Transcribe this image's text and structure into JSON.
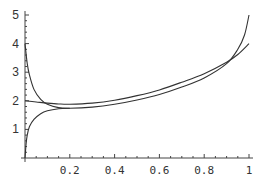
{
  "chart_data": {
    "type": "line",
    "title": "",
    "xlabel": "",
    "ylabel": "",
    "xlim": [
      0,
      1
    ],
    "ylim": [
      0,
      5
    ],
    "grid": false,
    "legend": null,
    "x_ticks": [
      "0.2",
      "0.4",
      "0.6",
      "0.8",
      "1"
    ],
    "y_ticks": [
      "1",
      "2",
      "3",
      "4",
      "5"
    ],
    "series": [
      {
        "name": "curve-a",
        "x": [
          0.0,
          0.05,
          0.1,
          0.15,
          0.2,
          0.3,
          0.4,
          0.5,
          0.6,
          0.7,
          0.8,
          0.9,
          0.95,
          1.0
        ],
        "y": [
          2.0,
          1.96,
          1.92,
          1.89,
          1.88,
          1.92,
          2.02,
          2.18,
          2.38,
          2.65,
          2.95,
          3.35,
          3.62,
          4.0
        ]
      },
      {
        "name": "curve-b",
        "x": [
          0.0,
          0.01,
          0.02,
          0.04,
          0.07,
          0.1,
          0.15,
          0.2,
          0.3,
          0.4,
          0.5,
          0.6,
          0.7,
          0.8,
          0.9,
          0.95,
          0.98,
          1.0
        ],
        "y": [
          4.0,
          3.3,
          2.9,
          2.4,
          2.05,
          1.88,
          1.76,
          1.74,
          1.78,
          1.88,
          2.03,
          2.22,
          2.48,
          2.8,
          3.3,
          3.8,
          4.3,
          5.0
        ]
      },
      {
        "name": "curve-c",
        "x": [
          0.0,
          0.005,
          0.01,
          0.02,
          0.04,
          0.07,
          0.1,
          0.15,
          0.2
        ],
        "y": [
          0.0,
          0.5,
          0.8,
          1.1,
          1.35,
          1.55,
          1.65,
          1.72,
          1.74
        ]
      }
    ]
  },
  "layout": {
    "x0_px": 25,
    "x1_px": 249,
    "y0_px": 158,
    "y1_px": 15
  }
}
